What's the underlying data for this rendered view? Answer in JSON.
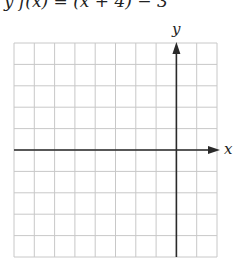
{
  "header": {
    "formula_fragment": "y f(x) = (x + 4) − 3"
  },
  "graph": {
    "x_label": "x",
    "y_label": "y",
    "grid": {
      "columns": 10,
      "rows": 10,
      "left": 14,
      "top": 43,
      "right": 217,
      "bottom": 257,
      "y_axis_column": 8,
      "x_axis_row": 5
    },
    "colors": {
      "grid": "#c8c8c8",
      "axis": "#2a2a2a"
    }
  },
  "chart_data": {
    "type": "table",
    "title": "",
    "xlabel": "x",
    "ylabel": "y",
    "grid": true,
    "x_range_squares": [
      -8,
      2
    ],
    "y_range_squares": [
      -5,
      5
    ],
    "series": []
  }
}
